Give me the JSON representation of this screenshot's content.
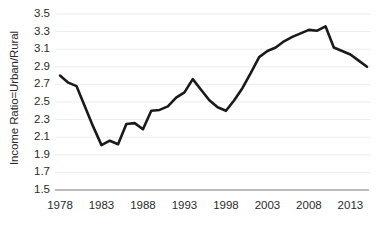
{
  "chart_data": {
    "type": "line",
    "title": "",
    "xlabel": "",
    "ylabel": "Income Ratio=Urban/Rural",
    "xlim": [
      1978,
      2015
    ],
    "ylim": [
      1.5,
      3.5
    ],
    "ytick_step": 0.2,
    "grid": true,
    "legend": false,
    "line_color": "#1a1a1a",
    "gridline_color": "#ededed",
    "axis_color": "#a6a6a6",
    "background_color": "#ffffff",
    "xticks": [
      1978,
      1983,
      1988,
      1993,
      1998,
      2003,
      2008,
      2013
    ],
    "xtick_labels": [
      "1978",
      "1983",
      "1988",
      "1993",
      "1998",
      "2003",
      "2008",
      "2013"
    ],
    "yticks": [
      1.5,
      1.7,
      1.9,
      2.1,
      2.3,
      2.5,
      2.7,
      2.9,
      3.1,
      3.3,
      3.5
    ],
    "ytick_labels": [
      "1.5",
      "1.7",
      "1.9",
      "2.1",
      "2.3",
      "2.5",
      "2.7",
      "2.9",
      "3.1",
      "3.3",
      "3.5"
    ],
    "x": [
      1978,
      1979,
      1980,
      1981,
      1982,
      1983,
      1984,
      1985,
      1986,
      1987,
      1988,
      1989,
      1990,
      1991,
      1992,
      1993,
      1994,
      1995,
      1996,
      1997,
      1998,
      1999,
      2000,
      2001,
      2002,
      2003,
      2004,
      2005,
      2006,
      2007,
      2008,
      2009,
      2010,
      2011,
      2012,
      2013,
      2014,
      2015
    ],
    "values": [
      2.8,
      2.72,
      2.68,
      2.45,
      2.22,
      2.01,
      2.06,
      2.02,
      2.25,
      2.26,
      2.19,
      2.4,
      2.41,
      2.45,
      2.55,
      2.61,
      2.76,
      2.64,
      2.52,
      2.44,
      2.4,
      2.52,
      2.66,
      2.83,
      3.01,
      3.08,
      3.12,
      3.19,
      3.24,
      3.28,
      3.32,
      3.31,
      3.36,
      3.12,
      3.08,
      3.04,
      2.97,
      2.9
    ],
    "series_name": "Income Ratio=Urban/Rural"
  }
}
